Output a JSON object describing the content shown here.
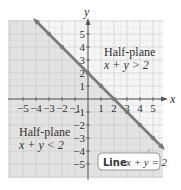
{
  "colors": {
    "background": "#ffffff",
    "shaded_region": "#e3e3e3",
    "unshaded_region": "#f5f5f5",
    "grid_line": "#c8c8c8",
    "axis": "#555555",
    "boundary_line": "#7a7a7a",
    "point": "#7a7a7a",
    "text": "#333333"
  },
  "axes": {
    "x_label": "x",
    "y_label": "y",
    "x_ticks": [
      "-5",
      "-4",
      "-3",
      "-2",
      "-1",
      "1",
      "2",
      "3",
      "4",
      "5"
    ],
    "y_ticks": [
      "5",
      "4",
      "3",
      "2",
      "1",
      "-1",
      "-2",
      "-3",
      "-4",
      "-5"
    ]
  },
  "annotations": {
    "upper_region_title": "Half-plane",
    "upper_region_inequality": "x + y > 2",
    "lower_region_title": "Half-plane",
    "lower_region_inequality": "x + y < 2",
    "line_label_prefix": "Line",
    "line_label_equation": "x + y = 2"
  },
  "chart_data": {
    "type": "line",
    "title": "",
    "xlabel": "x",
    "ylabel": "y",
    "xlim": [
      -6,
      6
    ],
    "ylim": [
      -6,
      6
    ],
    "grid": true,
    "boundary_line": {
      "equation": "x + y = 2",
      "style": "solid"
    },
    "points_on_line": [
      {
        "x": -3,
        "y": 5
      },
      {
        "x": -2,
        "y": 4
      },
      {
        "x": 0,
        "y": 2
      },
      {
        "x": 1,
        "y": 1
      },
      {
        "x": 2,
        "y": 0
      },
      {
        "x": 3,
        "y": -1
      },
      {
        "x": 4,
        "y": -2
      },
      {
        "x": 5,
        "y": -3
      }
    ],
    "shaded_region": "x + y < 2",
    "regions": [
      {
        "label": "Half-plane x + y > 2",
        "shaded": false
      },
      {
        "label": "Half-plane x + y < 2",
        "shaded": true
      }
    ]
  }
}
